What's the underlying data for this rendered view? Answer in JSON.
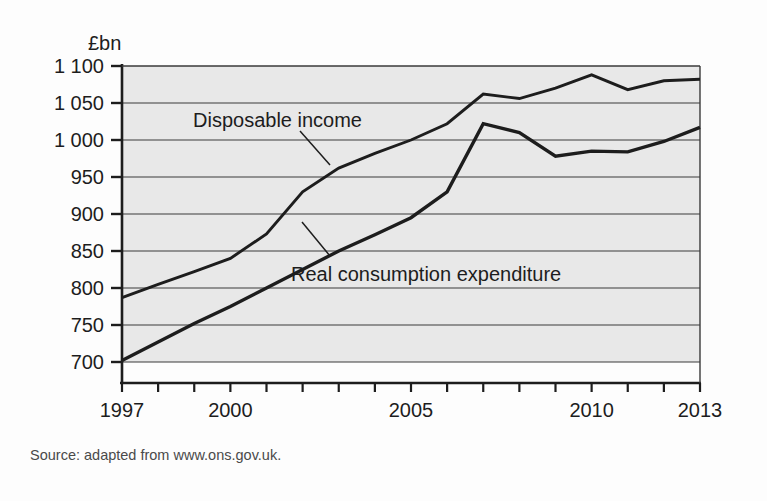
{
  "chart_data": {
    "type": "line",
    "title": "",
    "subtitle": "",
    "xlabel": "",
    "ylabel": "£bn",
    "x": [
      1997,
      1998,
      1999,
      2000,
      2001,
      2002,
      2003,
      2004,
      2005,
      2006,
      2007,
      2008,
      2009,
      2010,
      2011,
      2012,
      2013
    ],
    "xlim": [
      1997,
      2013
    ],
    "ylim": [
      700,
      1100
    ],
    "xticks": [
      1997,
      1998,
      1999,
      2000,
      2001,
      2002,
      2003,
      2004,
      2005,
      2006,
      2007,
      2008,
      2009,
      2010,
      2011,
      2012,
      2013
    ],
    "xtick_labels_shown": [
      "1997",
      "2000",
      "2005",
      "2010",
      "2013"
    ],
    "yticks": [
      700,
      750,
      800,
      850,
      900,
      950,
      1000,
      1050,
      1100
    ],
    "ytick_labels": [
      "700",
      "750",
      "800",
      "850",
      "900",
      "950",
      "1 000",
      "1 050",
      "1 100"
    ],
    "grid": "horizontal",
    "legend_position": "inline-annotations",
    "plot_background": "#e8e8e8",
    "line_color": "#1d1d1d",
    "series": [
      {
        "name": "Disposable income",
        "values": [
          787,
          805,
          822,
          840,
          873,
          930,
          962,
          982,
          1000,
          1022,
          1062,
          1056,
          1070,
          1088,
          1068,
          1080,
          1082
        ]
      },
      {
        "name": "Real consumption expenditure",
        "values": [
          702,
          727,
          752,
          775,
          800,
          825,
          850,
          872,
          895,
          930,
          1022,
          1010,
          978,
          985,
          984,
          998,
          1017
        ]
      }
    ],
    "annotations": [
      {
        "text": "Disposable income",
        "series": "Disposable income"
      },
      {
        "text": "Real consumption expenditure",
        "series": "Real consumption expenditure"
      }
    ]
  },
  "source": {
    "text": "Source: adapted from www.ons.gov.uk."
  }
}
